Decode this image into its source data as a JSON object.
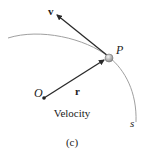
{
  "diagram": {
    "labels": {
      "velocity_vector": "v",
      "position_vector": "r",
      "point": "P",
      "origin": "O",
      "path": "s",
      "caption": "Velocity",
      "subfigure": "(c)"
    },
    "colors": {
      "curve": "#9a9a9a",
      "vector": "#2a2a2a",
      "particle": "#b8b8b8"
    }
  }
}
